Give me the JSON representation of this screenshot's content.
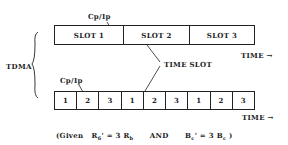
{
  "diagram": {
    "type": "tdma-frame-structure",
    "left_label": "TDMA",
    "top_frame": {
      "overhead_label": "Cp/Ip",
      "slots": [
        "SLOT 1",
        "SLOT 2",
        "SLOT 3"
      ],
      "time_label": "TIME",
      "arrow": "→"
    },
    "callout": "TIME SLOT",
    "bottom_frame": {
      "overhead_label": "Cp/Ip",
      "slots": [
        "1",
        "2",
        "3",
        "1",
        "2",
        "3",
        "1",
        "2",
        "3"
      ],
      "time_label": "TIME",
      "arrow": "→"
    },
    "caption": {
      "open": "(Given",
      "eq1_lhs": "R",
      "eq1_lhs_sub": "6",
      "eq1_rhs": "' = 3 R",
      "eq1_rhs_sub": "b",
      "conj": "AND",
      "eq2_lhs": "B",
      "eq2_lhs_sub": "c",
      "eq2_rhs": "' = 3 B",
      "eq2_rhs_sub": "c",
      "close": ")"
    }
  }
}
